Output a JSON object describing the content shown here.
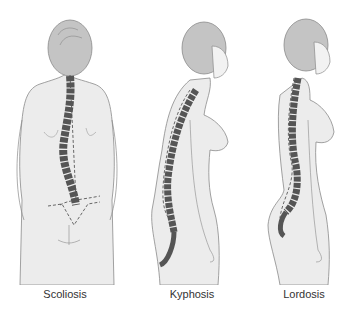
{
  "diagram": {
    "colors": {
      "body_fill": "#ececec",
      "outline": "#8a8a8a",
      "hair_fill": "#c4c4c4",
      "vertebra_fill": "#555555",
      "dashed_line": "#444444",
      "caption_text": "#333333"
    },
    "figures": [
      {
        "id": "scoliosis",
        "label": "Scoliosis",
        "view": "posterior"
      },
      {
        "id": "kyphosis",
        "label": "Kyphosis",
        "view": "lateral"
      },
      {
        "id": "lordosis",
        "label": "Lordosis",
        "view": "lateral"
      }
    ]
  }
}
